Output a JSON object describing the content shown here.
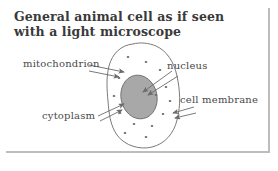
{
  "figure": {
    "title_lines": [
      "General animal cell as if seen",
      "with a light microscope"
    ],
    "background_color": "#ffffff",
    "border_color": "#bdbdbd",
    "ink_color": "#6b6b6b",
    "text_color": "#4a4a4a",
    "title_color": "#3a3a3a"
  },
  "diagram": {
    "type": "labelled-biological-diagram",
    "subject": "animal cell",
    "cell": {
      "name": "cell-outline",
      "shape": "irregular-oval",
      "fill": "#ffffff",
      "stroke": "#6b6b6b"
    },
    "nucleus": {
      "name": "nucleus-shape",
      "shape": "ellipse",
      "fill": "#a8a8a8",
      "stroke": "#6f6f6f"
    },
    "mitochondria_dots": {
      "name": "mitochondria-dots",
      "count": 14,
      "fill": "#6b6b6b"
    },
    "labels": [
      {
        "id": "mitochondrion",
        "text": "mitochondrion",
        "points_to": "mitochondria-dots",
        "arrow_style": "double-line"
      },
      {
        "id": "nucleus",
        "text": "nucleus",
        "points_to": "nucleus-shape",
        "arrow_style": "double-line"
      },
      {
        "id": "cell-membrane",
        "text": "cell membrane",
        "points_to": "cell-outline",
        "arrow_style": "double-line"
      },
      {
        "id": "cytoplasm",
        "text": "cytoplasm",
        "points_to": "cytoplasm-region",
        "arrow_style": "double-line"
      }
    ]
  }
}
